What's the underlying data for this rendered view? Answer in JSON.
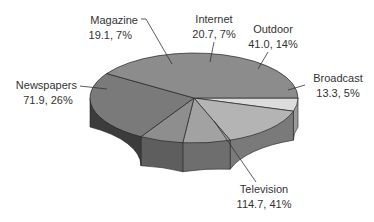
{
  "chart_data": {
    "type": "pie",
    "style": "3d",
    "title": "",
    "unit": "",
    "total": 280.7,
    "slices": [
      {
        "label": "Broadcast",
        "value": 13.3,
        "percent": 5,
        "display": "13.3, 5%",
        "color": "#dcdcdc",
        "side_color": "#9a9a9a"
      },
      {
        "label": "Outdoor",
        "value": 41.0,
        "percent": 14,
        "display": "41.0, 14%",
        "color": "#b4b4b4",
        "side_color": "#7a7a7a"
      },
      {
        "label": "Internet",
        "value": 20.7,
        "percent": 7,
        "display": "20.7, 7%",
        "color": "#a2a2a2",
        "side_color": "#6e6e6e"
      },
      {
        "label": "Magazine",
        "value": 19.1,
        "percent": 7,
        "display": "19.1, 7%",
        "color": "#8e8e8e",
        "side_color": "#5e5e5e"
      },
      {
        "label": "Newspapers",
        "value": 71.9,
        "percent": 26,
        "display": "71.9, 26%",
        "color": "#7a7a7a",
        "side_color": "#3c3c3c"
      },
      {
        "label": "Television",
        "value": 114.7,
        "percent": 41,
        "display": "114.7, 41%",
        "color": "#8c8c8c",
        "side_color": "#5c5c5c"
      }
    ],
    "legend": "none (labels with leader lines)"
  }
}
